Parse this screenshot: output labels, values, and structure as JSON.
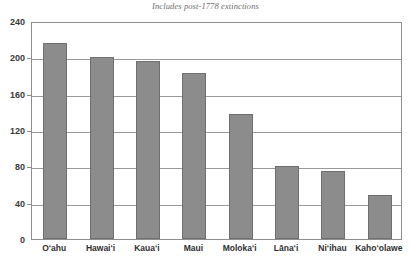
{
  "chart_data": {
    "type": "bar",
    "title": "Native Hawaiian Land Snail Species by Island",
    "subtitle": "Includes post-1778 extinctions",
    "categories": [
      "Oʻahu",
      "Hawaiʻi",
      "Kauaʻi",
      "Maui",
      "Molokaʻi",
      "Lānaʻi",
      "Niʻihau",
      "Kahoʻolawe"
    ],
    "values": [
      216,
      200,
      196,
      183,
      138,
      80,
      75,
      48
    ],
    "xlabel": "",
    "ylabel": "",
    "ylim": [
      0,
      240
    ],
    "yticks": [
      0,
      40,
      80,
      120,
      160,
      200,
      240
    ],
    "ytick_labels": [
      "0",
      "40",
      "80",
      "120",
      "160",
      "200",
      "240"
    ],
    "grid": true,
    "legend": false,
    "bar_color": "#8c8c8c",
    "bar_border_color": "#6f6f6f",
    "gridline_color": "#9a9a9a",
    "axis_color": "#8e8e8e",
    "background_color": "#ffffff"
  }
}
